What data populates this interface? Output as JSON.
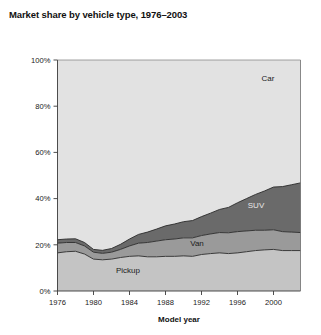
{
  "figure": {
    "title": "Market share by vehicle type, 1976–2003",
    "background": "#ffffff"
  },
  "axes": {
    "x": {
      "title": "Model year",
      "ticks": [
        "1976",
        "1980",
        "1984",
        "1988",
        "1992",
        "1996",
        "2000"
      ],
      "range": [
        1976,
        2003
      ]
    },
    "y": {
      "title": "",
      "ticks": [
        "0%",
        "20%",
        "40%",
        "60%",
        "80%",
        "100%"
      ],
      "range": [
        0,
        100
      ]
    }
  },
  "series_labels": {
    "car": "Car",
    "suv": "SUV",
    "van": "Van",
    "pickup": "Pickup"
  },
  "colors": {
    "car": "#e2e2e2",
    "suv": "#6a6a6a",
    "van": "#9a9a9a",
    "pickup": "#c4c4c4",
    "outline": "#2a2a2a",
    "text": "#1a1a1a",
    "title": "#111111"
  },
  "chart_data": {
    "type": "area",
    "title": "Market share by vehicle type, 1976–2003",
    "xlabel": "Model year",
    "ylabel": "",
    "xlim": [
      1976,
      2003
    ],
    "ylim": [
      0,
      100
    ],
    "grid": false,
    "legend": "inline-annotations",
    "stacked": true,
    "stack_order": [
      "Pickup",
      "Van",
      "SUV",
      "Car"
    ],
    "x": [
      1976,
      1977,
      1978,
      1979,
      1980,
      1981,
      1982,
      1983,
      1984,
      1985,
      1986,
      1987,
      1988,
      1989,
      1990,
      1991,
      1992,
      1993,
      1994,
      1995,
      1996,
      1997,
      1998,
      1999,
      2000,
      2001,
      2002,
      2003
    ],
    "series": [
      {
        "name": "Pickup",
        "values": [
          16.5,
          17.0,
          17.2,
          16.0,
          13.8,
          13.5,
          13.8,
          14.5,
          15.0,
          15.2,
          14.8,
          14.8,
          15.0,
          15.0,
          15.2,
          15.0,
          15.8,
          16.2,
          16.5,
          16.2,
          16.5,
          17.0,
          17.5,
          17.8,
          18.0,
          17.5,
          17.5,
          17.5
        ]
      },
      {
        "name": "Van",
        "values": [
          4.2,
          4.0,
          3.8,
          3.5,
          3.0,
          2.8,
          3.0,
          3.5,
          4.5,
          5.5,
          6.2,
          6.8,
          7.2,
          7.5,
          7.8,
          8.0,
          8.2,
          8.5,
          8.8,
          9.0,
          9.2,
          9.0,
          8.8,
          8.5,
          8.5,
          8.2,
          8.0,
          7.8
        ]
      },
      {
        "name": "SUV",
        "values": [
          1.5,
          1.5,
          1.6,
          1.5,
          1.2,
          1.3,
          1.6,
          2.2,
          3.0,
          3.8,
          4.5,
          5.2,
          6.0,
          6.5,
          7.0,
          7.5,
          8.2,
          9.0,
          10.0,
          11.0,
          12.5,
          14.0,
          15.5,
          17.0,
          18.5,
          19.5,
          20.5,
          21.5
        ]
      },
      {
        "name": "Car",
        "values": [
          77.8,
          77.5,
          77.4,
          79.0,
          82.0,
          82.4,
          81.6,
          79.8,
          77.5,
          75.5,
          74.5,
          73.2,
          71.8,
          71.0,
          70.0,
          69.5,
          67.8,
          66.3,
          64.7,
          63.8,
          61.8,
          60.0,
          58.2,
          56.7,
          55.0,
          54.8,
          54.0,
          53.2
        ]
      }
    ],
    "annotations": [
      {
        "label": "Car",
        "x": 2000,
        "y": 88
      },
      {
        "label": "SUV",
        "x": 1998,
        "y": 37
      },
      {
        "label": "Van",
        "x": 1990,
        "y": 21
      },
      {
        "label": "Pickup",
        "x": 1984,
        "y": 9
      }
    ]
  }
}
